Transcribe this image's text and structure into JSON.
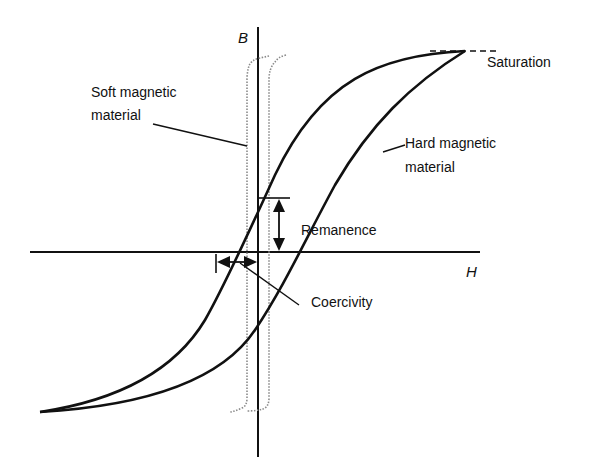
{
  "axes": {
    "x_label": "H",
    "y_label": "B"
  },
  "labels": {
    "saturation": "Saturation",
    "soft_line1": "Soft magnetic",
    "soft_line2": "material",
    "hard_line1": "Hard magnetic",
    "hard_line2": "material",
    "remanence": "Remanence",
    "coercivity": "Coercivity"
  },
  "curves": [
    {
      "name": "Hard magnetic material",
      "style": "solid",
      "color": "#111111"
    },
    {
      "name": "Soft magnetic material",
      "style": "dotted",
      "color": "#8a8a8a"
    }
  ],
  "colors": {
    "line": "#111111",
    "soft_loop": "#8a8a8a",
    "background": "#ffffff"
  }
}
